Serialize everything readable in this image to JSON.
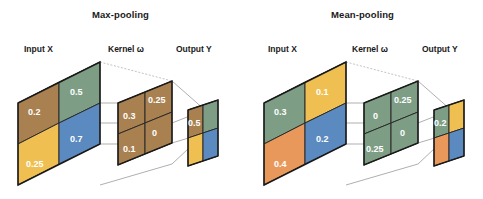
{
  "figure": {
    "width": 483,
    "height": 199,
    "background": "#ffffff"
  },
  "palette": {
    "brown": "#A98050",
    "green": "#7D9E85",
    "blue": "#5B8AC0",
    "yellow": "#EFBF52",
    "orange": "#E8985A",
    "outline": "#1a1a1a",
    "connector": "#8c8c8c",
    "value_text": "#ffffff",
    "label_text": "#1a1a1a"
  },
  "panels": [
    {
      "id": "max-pooling",
      "title": "Max-pooling",
      "labels": {
        "input": "Input X",
        "kernel": "Kernel ω",
        "output": "Output Y"
      },
      "input": {
        "name": "Input X",
        "rows": 2,
        "cols": 2,
        "cells": [
          {
            "value": "0.2",
            "color": "#A98050",
            "row": 0,
            "col": 0,
            "show_value": true
          },
          {
            "value": "0.5",
            "color": "#7D9E85",
            "row": 0,
            "col": 1,
            "show_value": true
          },
          {
            "value": "0.25",
            "color": "#EFBF52",
            "row": 1,
            "col": 0,
            "show_value": true
          },
          {
            "value": "0.7",
            "color": "#5B8AC0",
            "row": 1,
            "col": 1,
            "show_value": true
          }
        ]
      },
      "kernel": {
        "name": "Kernel ω",
        "rows": 2,
        "cols": 2,
        "cells": [
          {
            "value": "0.3",
            "color": "#A98050",
            "row": 0,
            "col": 0,
            "show_value": true
          },
          {
            "value": "0.25",
            "color": "#A98050",
            "row": 0,
            "col": 1,
            "show_value": true
          },
          {
            "value": "0.1",
            "color": "#A98050",
            "row": 1,
            "col": 0,
            "show_value": true
          },
          {
            "value": "0",
            "color": "#A98050",
            "row": 1,
            "col": 1,
            "show_value": true
          }
        ]
      },
      "output": {
        "name": "Output Y",
        "rows": 2,
        "cols": 2,
        "cells": [
          {
            "value": "0.5",
            "color": "#A98050",
            "row": 0,
            "col": 0,
            "show_value": true
          },
          {
            "value": "",
            "color": "#7D9E85",
            "row": 0,
            "col": 1,
            "show_value": false
          },
          {
            "value": "",
            "color": "#EFBF52",
            "row": 1,
            "col": 0,
            "show_value": false
          },
          {
            "value": "",
            "color": "#5B8AC0",
            "row": 1,
            "col": 1,
            "show_value": false
          }
        ]
      }
    },
    {
      "id": "mean-pooling",
      "title": "Mean-pooling",
      "labels": {
        "input": "Input X",
        "kernel": "Kernel ω",
        "output": "Output Y"
      },
      "input": {
        "name": "Input X",
        "rows": 2,
        "cols": 2,
        "cells": [
          {
            "value": "0.3",
            "color": "#7D9E85",
            "row": 0,
            "col": 0,
            "show_value": true
          },
          {
            "value": "0.1",
            "color": "#EFBF52",
            "row": 0,
            "col": 1,
            "show_value": true
          },
          {
            "value": "0.4",
            "color": "#E8985A",
            "row": 1,
            "col": 0,
            "show_value": true
          },
          {
            "value": "0.2",
            "color": "#5B8AC0",
            "row": 1,
            "col": 1,
            "show_value": true
          }
        ]
      },
      "kernel": {
        "name": "Kernel ω",
        "rows": 2,
        "cols": 2,
        "cells": [
          {
            "value": "0",
            "color": "#7D9E85",
            "row": 0,
            "col": 0,
            "show_value": true
          },
          {
            "value": "0.25",
            "color": "#7D9E85",
            "row": 0,
            "col": 1,
            "show_value": true
          },
          {
            "value": "0.25",
            "color": "#7D9E85",
            "row": 1,
            "col": 0,
            "show_value": true
          },
          {
            "value": "0",
            "color": "#7D9E85",
            "row": 1,
            "col": 1,
            "show_value": true
          }
        ]
      },
      "output": {
        "name": "Output Y",
        "rows": 2,
        "cols": 2,
        "cells": [
          {
            "value": "0.2",
            "color": "#7D9E85",
            "row": 0,
            "col": 0,
            "show_value": true
          },
          {
            "value": "",
            "color": "#EFBF52",
            "row": 0,
            "col": 1,
            "show_value": false
          },
          {
            "value": "",
            "color": "#E8985A",
            "row": 1,
            "col": 0,
            "show_value": false
          },
          {
            "value": "",
            "color": "#5B8AC0",
            "row": 1,
            "col": 1,
            "show_value": false
          }
        ]
      }
    }
  ]
}
